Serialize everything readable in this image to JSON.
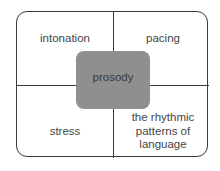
{
  "diagram": {
    "center": "prosody",
    "quadrants": {
      "top_left": "intonation",
      "top_right": "pacing",
      "bottom_left": "stress",
      "bottom_right": [
        "the rhythmic",
        "patterns of",
        "language"
      ]
    },
    "colors": {
      "center_fill": "#8f8f8f",
      "lines": "#3a3a3a",
      "background": "#ffffff"
    }
  }
}
